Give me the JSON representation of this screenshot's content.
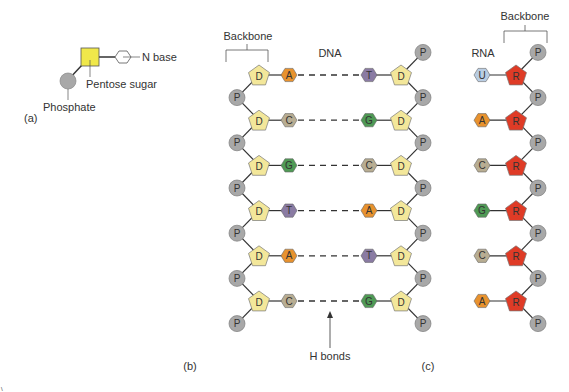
{
  "panel_a": {
    "label": "(a)",
    "n_base_label": "N base",
    "sugar_label": "Pentose sugar",
    "phosphate_label": "Phosphate"
  },
  "panel_b": {
    "label": "(b)",
    "title": "DNA",
    "backbone_label": "Backbone",
    "h_bonds_label": "H bonds",
    "sugar_glyph": "D",
    "phosphate_glyph": "P",
    "pairs": [
      {
        "left": "A",
        "right": "T"
      },
      {
        "left": "C",
        "right": "G"
      },
      {
        "left": "G",
        "right": "C"
      },
      {
        "left": "T",
        "right": "A"
      },
      {
        "left": "A",
        "right": "T"
      },
      {
        "left": "C",
        "right": "G"
      }
    ]
  },
  "panel_c": {
    "label": "(c)",
    "title": "RNA",
    "backbone_label": "Backbone",
    "sugar_glyph": "R",
    "phosphate_glyph": "P",
    "bases": [
      "U",
      "A",
      "C",
      "G",
      "C",
      "A"
    ]
  },
  "colors": {
    "A": "#e8922e",
    "T": "#8a7ba3",
    "C": "#b8ad92",
    "G": "#4f9a55",
    "U": "#b9cde3",
    "deoxyribose": "#f3e79a",
    "ribose": "#df3b26",
    "phosphate": "#a8a8a8",
    "sugar_square": "#f0e84a",
    "line": "#333333"
  }
}
